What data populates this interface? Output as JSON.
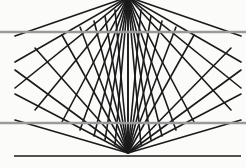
{
  "figure": {
    "name": "wundt-hering-illusion",
    "width": 246,
    "height": 168,
    "background_color": "#fbfbfa"
  },
  "colors": {
    "ray_color": "#1a1a1a",
    "gray_line_color": "#9a9a9a",
    "baseline_color": "#1a1a1a",
    "background": "#fbfbfa"
  },
  "chart_data": {
    "type": "line",
    "xlabel": "",
    "ylabel": "",
    "xlim": [
      0,
      246
    ],
    "ylim": [
      0,
      168
    ],
    "grid": false,
    "legend": null,
    "annotations": [],
    "vertices": {
      "top": {
        "x": 128,
        "y": -3
      },
      "bottom": {
        "x": 128,
        "y": 153
      }
    },
    "ray_count_per_vertex": 13,
    "ray_stroke_width": 1.6,
    "series": [
      {
        "name": "top-fan-rays",
        "origin": {
          "x": 128,
          "y": -3
        },
        "endpoints": [
          {
            "x": 15,
            "y": 36
          },
          {
            "x": 15,
            "y": 62
          },
          {
            "x": 15,
            "y": 88
          },
          {
            "x": 35,
            "y": 110
          },
          {
            "x": 62,
            "y": 122
          },
          {
            "x": 80,
            "y": 130
          },
          {
            "x": 94,
            "y": 136
          },
          {
            "x": 105,
            "y": 140
          },
          {
            "x": 115,
            "y": 145
          },
          {
            "x": 128,
            "y": 152
          },
          {
            "x": 141,
            "y": 145
          },
          {
            "x": 151,
            "y": 140
          },
          {
            "x": 162,
            "y": 136
          },
          {
            "x": 176,
            "y": 130
          },
          {
            "x": 194,
            "y": 122
          },
          {
            "x": 231,
            "y": 110
          },
          {
            "x": 241,
            "y": 88
          },
          {
            "x": 241,
            "y": 62
          },
          {
            "x": 241,
            "y": 36
          }
        ]
      },
      {
        "name": "bottom-fan-rays",
        "origin": {
          "x": 128,
          "y": 153
        },
        "endpoints": [
          {
            "x": 15,
            "y": 120
          },
          {
            "x": 15,
            "y": 94
          },
          {
            "x": 15,
            "y": 70
          },
          {
            "x": 35,
            "y": 48
          },
          {
            "x": 62,
            "y": 35
          },
          {
            "x": 80,
            "y": 27
          },
          {
            "x": 94,
            "y": 21
          },
          {
            "x": 105,
            "y": 16
          },
          {
            "x": 115,
            "y": 10
          },
          {
            "x": 128,
            "y": 2
          },
          {
            "x": 141,
            "y": 10
          },
          {
            "x": 151,
            "y": 16
          },
          {
            "x": 162,
            "y": 21
          },
          {
            "x": 176,
            "y": 27
          },
          {
            "x": 194,
            "y": 35
          },
          {
            "x": 231,
            "y": 48
          },
          {
            "x": 241,
            "y": 70
          },
          {
            "x": 241,
            "y": 94
          },
          {
            "x": 241,
            "y": 120
          }
        ]
      }
    ],
    "horizontal_lines": [
      {
        "name": "upper-gray-line",
        "y": 32,
        "x_start": 0,
        "x_end": 246,
        "color": "#9a9a9a",
        "width": 2.6
      },
      {
        "name": "lower-gray-line",
        "y": 123,
        "x_start": 0,
        "x_end": 246,
        "color": "#9a9a9a",
        "width": 2.6
      },
      {
        "name": "bottom-black-baseline",
        "y": 156,
        "x_start": 14,
        "x_end": 241,
        "color": "#1a1a1a",
        "width": 1.6
      }
    ],
    "chevron_vertices_midline": {
      "y": 74,
      "left_x": [
        35,
        62,
        80,
        94,
        105,
        115
      ],
      "center_x": 128,
      "right_x": [
        141,
        151,
        162,
        176,
        194,
        221
      ]
    }
  }
}
